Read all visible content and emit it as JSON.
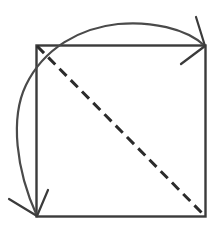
{
  "figure": {
    "kind": "geometry-diagram",
    "background_color": "#ffffff",
    "stroke_color": "#3b3b3b",
    "square_stroke_color": "#3b3b3b",
    "dash_stroke_color": "#2b2b2b",
    "arc_stroke_color": "#4a4a4a",
    "square": {
      "label": "square",
      "left": 36,
      "top": 45,
      "right": 205,
      "bottom": 216,
      "stroke_width": 2.4
    },
    "diagonal": {
      "label": "dashed-diagonal",
      "from_corner": "top-left",
      "to_corner": "bottom-right",
      "x1": 37,
      "y1": 46,
      "x2": 204,
      "y2": 215,
      "stroke_width": 3,
      "dash_length": 10,
      "gap_length": 6
    },
    "arc": {
      "label": "rotation-arc",
      "description": "arc sweeping counterclockwise from the top-right corner over the top of the square, around the left side, down to the bottom-left corner",
      "start_x": 205,
      "start_y": 46,
      "end_x": 37,
      "end_y": 216,
      "peak_x": 124,
      "peak_y": 23,
      "leftmost_x": 20,
      "leftmost_y": 131,
      "stroke_width": 2.2
    },
    "arrowheads": [
      {
        "label": "arrowhead-top-right",
        "tip_x": 205,
        "tip_y": 46,
        "barb1_x": 196,
        "barb1_y": 17,
        "barb2_x": 181,
        "barb2_y": 64,
        "stroke_width": 2.2
      },
      {
        "label": "arrowhead-bottom-left",
        "tip_x": 37,
        "tip_y": 216,
        "barb1_x": 9,
        "barb1_y": 199,
        "barb2_x": 48,
        "barb2_y": 190,
        "stroke_width": 2.2
      }
    ]
  }
}
